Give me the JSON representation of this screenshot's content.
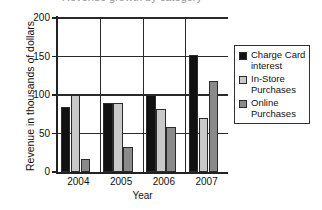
{
  "title_fragment": "Revenue growth by category",
  "chart_data": {
    "type": "bar",
    "title": "",
    "xlabel": "Year",
    "ylabel": "Revenue in thousands of dollars",
    "categories": [
      "2004",
      "2005",
      "2006",
      "2007"
    ],
    "yticks": [
      0,
      50,
      100,
      150,
      200
    ],
    "ylim": [
      0,
      200
    ],
    "grid": true,
    "legend_position": "right",
    "series": [
      {
        "name": "Charge Card interest",
        "color": "#111111",
        "values": [
          85,
          90,
          100,
          152
        ]
      },
      {
        "name": "In-Store Purchases",
        "color": "#c9c9c9",
        "values": [
          100,
          90,
          82,
          70
        ]
      },
      {
        "name": "Online Purchases",
        "color": "#8a8a8a",
        "values": [
          17,
          32,
          59,
          118
        ]
      }
    ]
  }
}
